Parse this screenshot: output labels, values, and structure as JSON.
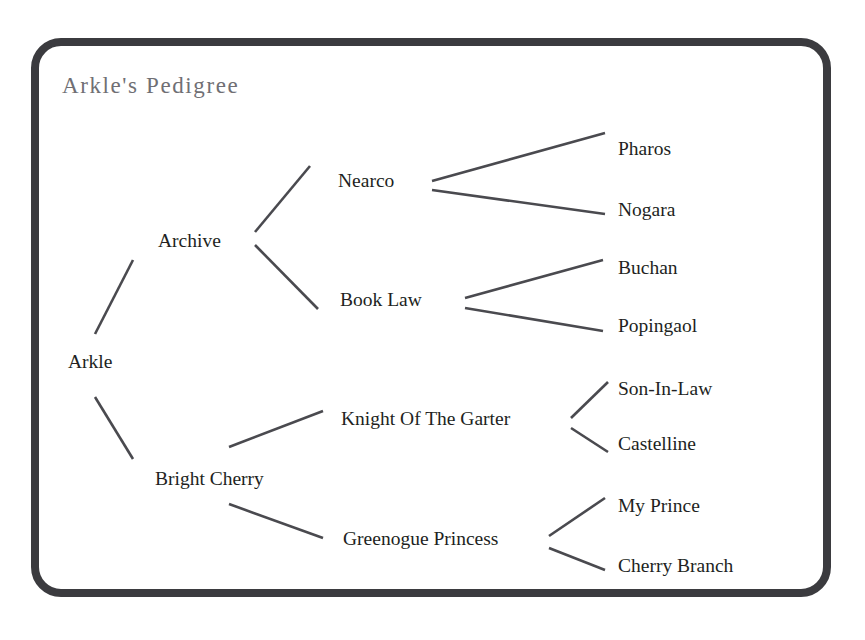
{
  "diagram": {
    "title": "Arkle's Pedigree",
    "type": "pedigree-tree",
    "title_color": "#706f74",
    "text_color": "#221f22",
    "line_color": "#4a4a4f",
    "border_color": "#3b3b3f",
    "background_color": "#ffffff",
    "generations": 4,
    "nodes": {
      "root": {
        "label": "Arkle",
        "x": 68,
        "y": 352,
        "generation": 0
      },
      "sire": {
        "label": "Archive",
        "x": 158,
        "y": 231,
        "generation": 1
      },
      "dam": {
        "label": "Bright Cherry",
        "x": 155,
        "y": 469,
        "generation": 1
      },
      "sire_sire": {
        "label": "Nearco",
        "x": 338,
        "y": 171,
        "generation": 2
      },
      "sire_dam": {
        "label": "Book Law",
        "x": 340,
        "y": 290,
        "generation": 2
      },
      "dam_sire": {
        "label": "Knight Of The Garter",
        "x": 341,
        "y": 409,
        "generation": 2
      },
      "dam_dam": {
        "label": "Greenogue Princess",
        "x": 343,
        "y": 529,
        "generation": 2
      },
      "g3_1": {
        "label": "Pharos",
        "x": 618,
        "y": 139,
        "generation": 3
      },
      "g3_2": {
        "label": "Nogara",
        "x": 618,
        "y": 200,
        "generation": 3
      },
      "g3_3": {
        "label": "Buchan",
        "x": 618,
        "y": 258,
        "generation": 3
      },
      "g3_4": {
        "label": "Popingaol",
        "x": 618,
        "y": 316,
        "generation": 3
      },
      "g3_5": {
        "label": "Son-In-Law",
        "x": 618,
        "y": 379,
        "generation": 3
      },
      "g3_6": {
        "label": "Castelline",
        "x": 618,
        "y": 434,
        "generation": 3
      },
      "g3_7": {
        "label": "My Prince",
        "x": 618,
        "y": 496,
        "generation": 3
      },
      "g3_8": {
        "label": "Cherry Branch",
        "x": 618,
        "y": 556,
        "generation": 3
      }
    },
    "edges": [
      {
        "from": "root",
        "to": "sire",
        "x1": 95,
        "y1": 334,
        "x2": 133,
        "y2": 260
      },
      {
        "from": "root",
        "to": "dam",
        "x1": 95,
        "y1": 397,
        "x2": 133,
        "y2": 459
      },
      {
        "from": "sire",
        "to": "sire_sire",
        "x1": 255,
        "y1": 232,
        "x2": 310,
        "y2": 166
      },
      {
        "from": "sire",
        "to": "sire_dam",
        "x1": 255,
        "y1": 245,
        "x2": 318,
        "y2": 309
      },
      {
        "from": "dam",
        "to": "dam_sire",
        "x1": 229,
        "y1": 447,
        "x2": 323,
        "y2": 411
      },
      {
        "from": "dam",
        "to": "dam_dam",
        "x1": 229,
        "y1": 504,
        "x2": 323,
        "y2": 538
      },
      {
        "from": "sire_sire",
        "to": "g3_1",
        "x1": 432,
        "y1": 181,
        "x2": 605,
        "y2": 133
      },
      {
        "from": "sire_sire",
        "to": "g3_2",
        "x1": 432,
        "y1": 190,
        "x2": 605,
        "y2": 214
      },
      {
        "from": "sire_dam",
        "to": "g3_3",
        "x1": 465,
        "y1": 298,
        "x2": 603,
        "y2": 260
      },
      {
        "from": "sire_dam",
        "to": "g3_4",
        "x1": 465,
        "y1": 308,
        "x2": 603,
        "y2": 331
      },
      {
        "from": "dam_sire",
        "to": "g3_5",
        "x1": 571,
        "y1": 418,
        "x2": 608,
        "y2": 382
      },
      {
        "from": "dam_sire",
        "to": "g3_6",
        "x1": 571,
        "y1": 428,
        "x2": 608,
        "y2": 452
      },
      {
        "from": "dam_dam",
        "to": "g3_7",
        "x1": 549,
        "y1": 536,
        "x2": 605,
        "y2": 498
      },
      {
        "from": "dam_dam",
        "to": "g3_8",
        "x1": 549,
        "y1": 548,
        "x2": 605,
        "y2": 570
      }
    ]
  }
}
